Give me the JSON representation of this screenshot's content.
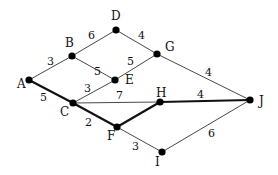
{
  "graph": {
    "nodes": [
      {
        "id": "A",
        "label": "A",
        "x": 29,
        "y": 80,
        "lx": 17,
        "ly": 88
      },
      {
        "id": "B",
        "label": "B",
        "x": 72,
        "y": 56,
        "lx": 65,
        "ly": 47
      },
      {
        "id": "C",
        "label": "C",
        "x": 73,
        "y": 103,
        "lx": 60,
        "ly": 116
      },
      {
        "id": "D",
        "label": "D",
        "x": 116,
        "y": 30,
        "lx": 111,
        "ly": 20
      },
      {
        "id": "E",
        "label": "E",
        "x": 115,
        "y": 80,
        "lx": 125,
        "ly": 84
      },
      {
        "id": "F",
        "label": "F",
        "x": 117,
        "y": 127,
        "lx": 107,
        "ly": 140
      },
      {
        "id": "G",
        "label": "G",
        "x": 157,
        "y": 54,
        "lx": 165,
        "ly": 51
      },
      {
        "id": "H",
        "label": "H",
        "x": 160,
        "y": 102,
        "lx": 156,
        "ly": 97
      },
      {
        "id": "I",
        "label": "I",
        "x": 162,
        "y": 152,
        "lx": 155,
        "ly": 166
      },
      {
        "id": "J",
        "label": "J",
        "x": 250,
        "y": 100,
        "lx": 259,
        "ly": 105
      }
    ],
    "edges": [
      {
        "from": "A",
        "to": "B",
        "weight": "3",
        "bold": false,
        "wx": 47,
        "wy": 65
      },
      {
        "from": "A",
        "to": "C",
        "weight": "5",
        "bold": true,
        "wx": 40,
        "wy": 101
      },
      {
        "from": "B",
        "to": "D",
        "weight": "6",
        "bold": false,
        "wx": 88,
        "wy": 39
      },
      {
        "from": "B",
        "to": "E",
        "weight": "5",
        "bold": false,
        "wx": 94,
        "wy": 75
      },
      {
        "from": "C",
        "to": "E",
        "weight": "3",
        "bold": false,
        "wx": 84,
        "wy": 92
      },
      {
        "from": "C",
        "to": "H",
        "weight": "7",
        "bold": false,
        "wx": 116,
        "wy": 99
      },
      {
        "from": "C",
        "to": "F",
        "weight": "2",
        "bold": true,
        "wx": 85,
        "wy": 126
      },
      {
        "from": "D",
        "to": "G",
        "weight": "4",
        "bold": false,
        "wx": 138,
        "wy": 39
      },
      {
        "from": "E",
        "to": "G",
        "weight": "5",
        "bold": false,
        "wx": 127,
        "wy": 65
      },
      {
        "from": "G",
        "to": "J",
        "weight": "4",
        "bold": false,
        "wx": 205,
        "wy": 76
      },
      {
        "from": "F",
        "to": "H",
        "weight": "",
        "bold": true,
        "wx": 0,
        "wy": 0
      },
      {
        "from": "H",
        "to": "J",
        "weight": "4",
        "bold": true,
        "wx": 197,
        "wy": 98
      },
      {
        "from": "F",
        "to": "I",
        "weight": "3",
        "bold": false,
        "wx": 132,
        "wy": 150
      },
      {
        "from": "I",
        "to": "J",
        "weight": "6",
        "bold": false,
        "wx": 208,
        "wy": 137
      }
    ]
  }
}
